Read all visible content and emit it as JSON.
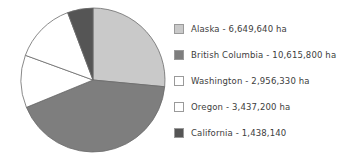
{
  "chart_data": {
    "type": "pie",
    "title": "",
    "subtitle": "",
    "xlabel": "",
    "ylabel": "",
    "grid": false,
    "legend_position": "right",
    "unit": "ha",
    "total": 25097110,
    "start_angle_deg": 0,
    "direction": "clockwise",
    "categories": [
      "Alaska",
      "British Columbia",
      "Washington",
      "Oregon",
      "California"
    ],
    "values": [
      6649640,
      10615800,
      2956330,
      3437200,
      1438140
    ],
    "percentages": [
      26.5,
      42.3,
      11.8,
      13.7,
      5.7
    ],
    "colors": [
      "#c9c9c9",
      "#7e7e7e",
      "#ffffff",
      "#ffffff",
      "#555555"
    ],
    "slice_border_color": "#6b6b6b",
    "slices": [
      {
        "label": "Alaska",
        "value": 6649640,
        "percent": 26.5,
        "color": "#c9c9c9"
      },
      {
        "label": "British Columbia",
        "value": 10615800,
        "percent": 42.3,
        "color": "#7e7e7e"
      },
      {
        "label": "Washington",
        "value": 2956330,
        "percent": 11.8,
        "color": "#ffffff"
      },
      {
        "label": "Oregon",
        "value": 3437200,
        "percent": 13.7,
        "color": "#ffffff"
      },
      {
        "label": "California",
        "value": 1438140,
        "percent": 5.7,
        "color": "#555555"
      }
    ]
  },
  "legend": {
    "items": [
      {
        "label": "Alaska - 6,649,640  ha",
        "color": "#c9c9c9",
        "swatch_name": "legend-swatch-alaska"
      },
      {
        "label": "British Columbia - 10,615,800 ha",
        "color": "#7e7e7e",
        "swatch_name": "legend-swatch-british-columbia"
      },
      {
        "label": "Washington - 2,956,330 ha",
        "color": "#ffffff",
        "swatch_name": "legend-swatch-washington"
      },
      {
        "label": "Oregon - 3,437,200 ha",
        "color": "#ffffff",
        "swatch_name": "legend-swatch-oregon"
      },
      {
        "label": "California - 1,438,140",
        "color": "#555555",
        "swatch_name": "legend-swatch-california"
      }
    ]
  }
}
